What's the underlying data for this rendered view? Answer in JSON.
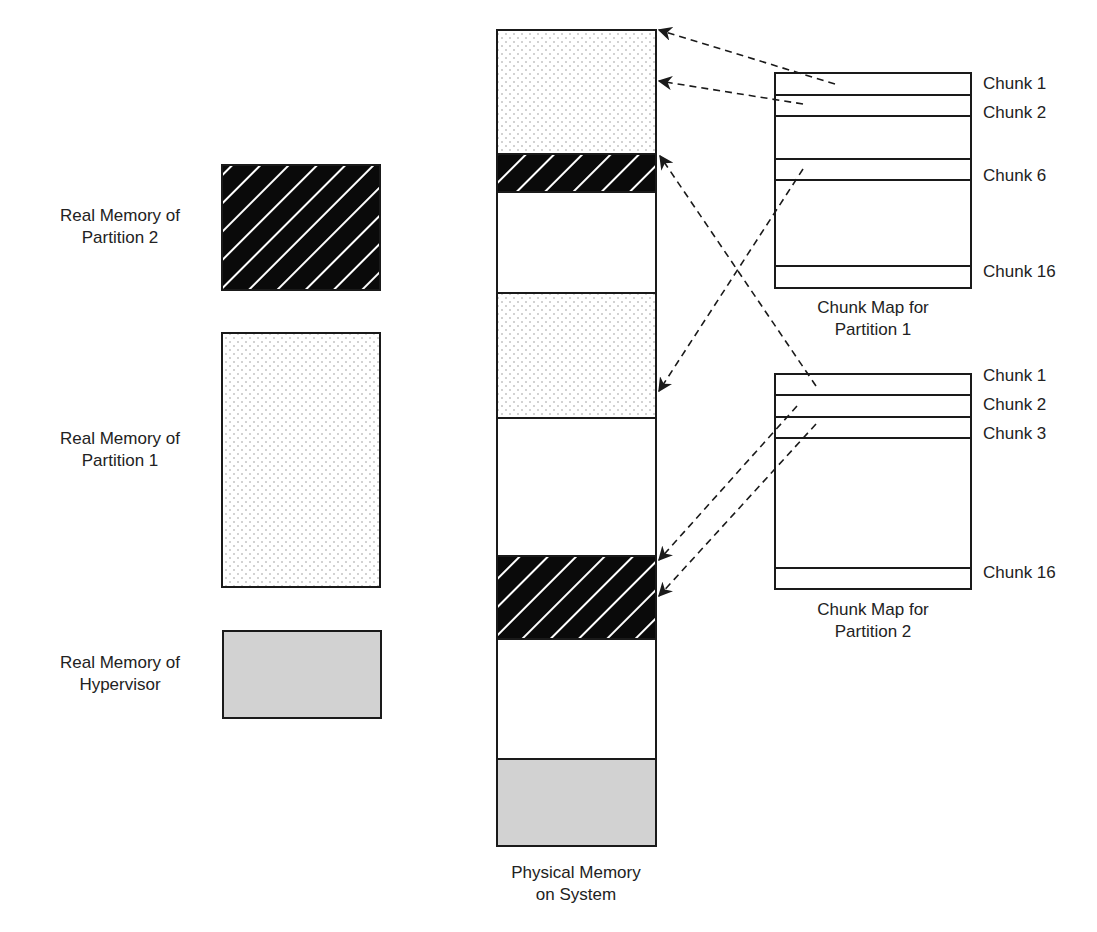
{
  "left_legend": {
    "partition2": {
      "label_line1": "Real Memory of",
      "label_line2": "Partition 2",
      "fill": "hatch"
    },
    "partition1": {
      "label_line1": "Real Memory of",
      "label_line2": "Partition 1",
      "fill": "dots"
    },
    "hypervisor": {
      "label_line1": "Real Memory of",
      "label_line2": "Hypervisor",
      "fill": "gray"
    }
  },
  "physical_memory": {
    "label_line1": "Physical Memory",
    "label_line2": "on System",
    "segments": [
      {
        "owner": "partition1",
        "fill": "dots"
      },
      {
        "owner": "partition2",
        "fill": "hatch"
      },
      {
        "owner": "free",
        "fill": "white"
      },
      {
        "owner": "partition1",
        "fill": "dots"
      },
      {
        "owner": "free",
        "fill": "white"
      },
      {
        "owner": "partition2",
        "fill": "hatch"
      },
      {
        "owner": "free",
        "fill": "white"
      },
      {
        "owner": "hypervisor",
        "fill": "gray"
      }
    ]
  },
  "chunk_map_1": {
    "caption_line1": "Chunk Map for",
    "caption_line2": "Partition 1",
    "chunks": [
      "Chunk 1",
      "Chunk 2",
      "Chunk 6",
      "Chunk 16"
    ]
  },
  "chunk_map_2": {
    "caption_line1": "Chunk Map for",
    "caption_line2": "Partition 2",
    "chunks": [
      "Chunk 1",
      "Chunk 2",
      "Chunk 3",
      "Chunk 16"
    ]
  },
  "colors": {
    "stroke": "#1a1a1a",
    "hatch_bg": "#0a0a0a",
    "gray_fill": "#d2d2d2",
    "dot_color": "#9a9a9a"
  }
}
